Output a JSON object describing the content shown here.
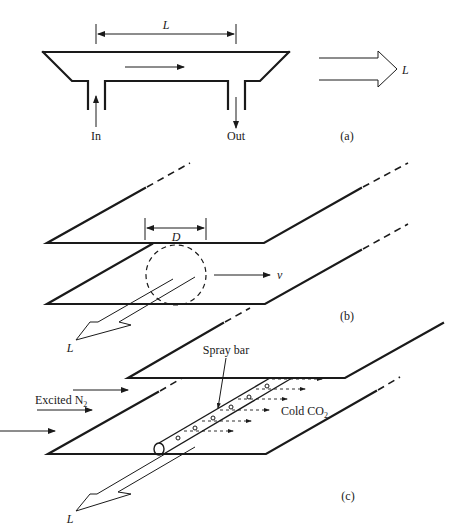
{
  "figure": {
    "panel_a": {
      "caption": "(a)",
      "length_label": "L",
      "inlet_label": "In",
      "outlet_label": "Out",
      "output_beam_label": "L"
    },
    "panel_b": {
      "caption": "(b)",
      "diameter_label": "D",
      "velocity_label": "v",
      "output_beam_label": "L"
    },
    "panel_c": {
      "caption": "(c)",
      "spray_bar_label": "Spray bar",
      "gas_in_label": "Excited N",
      "gas_in_subscript": "2",
      "coolant_label": "Cold CO",
      "coolant_subscript": "2",
      "output_beam_label": "L"
    }
  }
}
